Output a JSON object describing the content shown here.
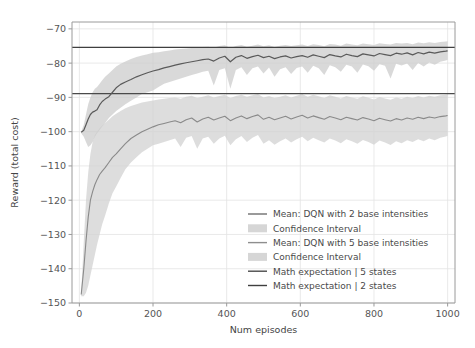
{
  "chart_data": {
    "type": "line",
    "title": "",
    "xlabel": "Num episodes",
    "ylabel": "Reward (total cost)",
    "xlim": [
      -20,
      1020
    ],
    "ylim": [
      -150,
      -68
    ],
    "xticks": [
      0,
      200,
      400,
      600,
      800,
      1000
    ],
    "yticks": [
      -70,
      -80,
      -90,
      -100,
      -110,
      -120,
      -130,
      -140,
      -150
    ],
    "xticklabels": [
      "0",
      "200",
      "400",
      "600",
      "800",
      "1000"
    ],
    "yticklabels": [
      "−70",
      "−80",
      "−90",
      "−100",
      "−110",
      "−120",
      "−130",
      "−140",
      "−150"
    ],
    "grid": true,
    "legend_position": "lower right",
    "colors": {
      "mean_2_base": "#5a5a5a",
      "ci_2_base": "#cccccc",
      "mean_5_base": "#8a8a8a",
      "ci_5_base": "#d2d2d2",
      "math_exp_5_states": "#4a4a4a",
      "math_exp_2_states": "#3f3f3f",
      "grid": "#e3e3e3",
      "spine": "#9a9a9a",
      "background": "#ffffff"
    },
    "hlines": [
      {
        "name": "Math expectation | 2 states",
        "value": -75.4
      },
      {
        "name": "Math expectation | 5 states",
        "value": -88.9
      }
    ],
    "series": [
      {
        "name": "Mean: DQN with 2 base intensities",
        "kind": "mean",
        "x": [
          5,
          12,
          18,
          24,
          30,
          36,
          42,
          48,
          55,
          62,
          70,
          80,
          90,
          100,
          112,
          125,
          140,
          155,
          170,
          185,
          200,
          215,
          230,
          245,
          260,
          275,
          290,
          305,
          320,
          335,
          350,
          365,
          380,
          395,
          410,
          425,
          440,
          455,
          470,
          485,
          500,
          515,
          530,
          545,
          560,
          575,
          590,
          605,
          620,
          635,
          650,
          665,
          680,
          695,
          710,
          725,
          740,
          755,
          770,
          785,
          800,
          815,
          830,
          845,
          860,
          875,
          890,
          905,
          920,
          935,
          950,
          965,
          980,
          995,
          1000
        ],
        "y": [
          -100.2,
          -99.6,
          -98.0,
          -96.3,
          -95.0,
          -94.3,
          -94.0,
          -93.6,
          -92.2,
          -91.2,
          -90.5,
          -89.8,
          -88.5,
          -87.2,
          -86.2,
          -85.5,
          -84.8,
          -84.0,
          -83.4,
          -82.8,
          -82.3,
          -81.9,
          -81.4,
          -81.0,
          -80.6,
          -80.2,
          -79.9,
          -79.6,
          -79.3,
          -79.0,
          -78.8,
          -79.4,
          -78.5,
          -78.0,
          -79.6,
          -78.3,
          -77.8,
          -78.6,
          -78.1,
          -77.7,
          -78.4,
          -78.0,
          -78.7,
          -78.2,
          -77.9,
          -78.5,
          -78.1,
          -77.8,
          -78.3,
          -77.6,
          -78.0,
          -78.4,
          -77.5,
          -77.9,
          -78.2,
          -77.4,
          -77.8,
          -78.1,
          -77.3,
          -77.6,
          -77.9,
          -77.2,
          -77.5,
          -77.8,
          -77.1,
          -77.4,
          -77.0,
          -77.6,
          -76.9,
          -77.3,
          -76.8,
          -77.1,
          -76.7,
          -76.5,
          -76.4
        ]
      },
      {
        "name": "Confidence Interval (2 base intensities)",
        "kind": "ci",
        "x": [
          5,
          12,
          18,
          24,
          30,
          36,
          42,
          48,
          55,
          62,
          70,
          80,
          90,
          100,
          112,
          125,
          140,
          155,
          170,
          185,
          200,
          215,
          230,
          245,
          260,
          275,
          290,
          305,
          320,
          335,
          350,
          365,
          380,
          395,
          410,
          425,
          440,
          455,
          470,
          485,
          500,
          515,
          530,
          545,
          560,
          575,
          590,
          605,
          620,
          635,
          650,
          665,
          680,
          695,
          710,
          725,
          740,
          755,
          770,
          785,
          800,
          815,
          830,
          845,
          860,
          875,
          890,
          905,
          920,
          935,
          950,
          965,
          980,
          995,
          1000
        ],
        "lower": [
          -100.5,
          -101.5,
          -103.0,
          -104.5,
          -104.0,
          -103.0,
          -101.5,
          -100.5,
          -99.5,
          -98.5,
          -97.5,
          -96.0,
          -95.0,
          -94.0,
          -93.0,
          -92.0,
          -91.0,
          -90.0,
          -89.0,
          -88.5,
          -88.0,
          -87.0,
          -86.0,
          -85.5,
          -85.0,
          -84.5,
          -84.0,
          -83.5,
          -83.0,
          -82.5,
          -82.2,
          -86.5,
          -82.0,
          -81.5,
          -87.5,
          -82.0,
          -81.2,
          -83.5,
          -81.5,
          -81.0,
          -83.0,
          -81.3,
          -84.0,
          -81.8,
          -81.2,
          -83.2,
          -81.4,
          -81.0,
          -82.8,
          -80.8,
          -81.5,
          -83.5,
          -80.6,
          -81.2,
          -82.5,
          -80.5,
          -81.0,
          -82.8,
          -80.4,
          -80.9,
          -82.2,
          -80.3,
          -80.8,
          -84.5,
          -80.2,
          -80.7,
          -80.1,
          -82.0,
          -80.0,
          -81.0,
          -79.8,
          -80.5,
          -79.6,
          -79.2,
          -79.0
        ],
        "upper": [
          -100.0,
          -98.0,
          -95.0,
          -92.0,
          -90.0,
          -88.5,
          -87.5,
          -87.0,
          -86.0,
          -85.0,
          -84.0,
          -83.0,
          -82.0,
          -81.0,
          -80.2,
          -79.5,
          -78.8,
          -78.2,
          -77.8,
          -77.4,
          -77.0,
          -76.8,
          -76.5,
          -76.3,
          -76.0,
          -75.9,
          -75.7,
          -75.6,
          -75.4,
          -75.3,
          -75.2,
          -75.5,
          -75.0,
          -74.8,
          -75.6,
          -75.0,
          -74.7,
          -75.2,
          -74.9,
          -74.6,
          -75.1,
          -74.8,
          -75.3,
          -74.9,
          -74.7,
          -75.0,
          -74.8,
          -74.6,
          -75.0,
          -74.5,
          -74.7,
          -75.1,
          -74.4,
          -74.6,
          -74.9,
          -74.3,
          -74.6,
          -74.8,
          -74.3,
          -74.5,
          -74.7,
          -74.2,
          -74.4,
          -74.6,
          -74.1,
          -74.3,
          -74.1,
          -74.5,
          -74.0,
          -74.2,
          -73.9,
          -74.1,
          -73.8,
          -73.7,
          -73.6
        ]
      },
      {
        "name": "Mean: DQN with 5 base intensities",
        "kind": "mean",
        "x": [
          5,
          12,
          18,
          24,
          30,
          36,
          42,
          48,
          55,
          62,
          70,
          80,
          90,
          100,
          112,
          125,
          140,
          155,
          170,
          185,
          200,
          215,
          230,
          245,
          260,
          275,
          290,
          305,
          320,
          335,
          350,
          365,
          380,
          395,
          410,
          425,
          440,
          455,
          470,
          485,
          500,
          515,
          530,
          545,
          560,
          575,
          590,
          605,
          620,
          635,
          650,
          665,
          680,
          695,
          710,
          725,
          740,
          755,
          770,
          785,
          800,
          815,
          830,
          845,
          860,
          875,
          890,
          905,
          920,
          935,
          950,
          965,
          980,
          995,
          1000
        ],
        "y": [
          -147.5,
          -140.0,
          -132.0,
          -125.0,
          -120.0,
          -117.5,
          -115.5,
          -114.0,
          -112.5,
          -111.5,
          -110.5,
          -109.0,
          -107.5,
          -106.5,
          -105.0,
          -103.5,
          -102.0,
          -101.0,
          -100.0,
          -99.3,
          -98.6,
          -98.0,
          -97.6,
          -97.2,
          -96.8,
          -97.4,
          -96.5,
          -96.0,
          -97.2,
          -96.3,
          -95.8,
          -96.6,
          -96.0,
          -95.5,
          -96.8,
          -96.0,
          -95.4,
          -96.2,
          -95.6,
          -95.1,
          -96.4,
          -95.8,
          -96.5,
          -96.0,
          -95.5,
          -96.3,
          -95.7,
          -95.2,
          -96.0,
          -95.4,
          -95.9,
          -96.4,
          -95.6,
          -96.0,
          -96.5,
          -95.8,
          -96.2,
          -96.6,
          -95.9,
          -96.3,
          -96.8,
          -96.1,
          -96.5,
          -96.9,
          -96.2,
          -96.6,
          -96.0,
          -96.4,
          -95.8,
          -96.2,
          -95.7,
          -96.0,
          -95.6,
          -95.4,
          -95.3
        ]
      },
      {
        "name": "Confidence Interval (5 base intensities)",
        "kind": "ci",
        "x": [
          5,
          12,
          18,
          24,
          30,
          36,
          42,
          48,
          55,
          62,
          70,
          80,
          90,
          100,
          112,
          125,
          140,
          155,
          170,
          185,
          200,
          215,
          230,
          245,
          260,
          275,
          290,
          305,
          320,
          335,
          350,
          365,
          380,
          395,
          410,
          425,
          440,
          455,
          470,
          485,
          500,
          515,
          530,
          545,
          560,
          575,
          590,
          605,
          620,
          635,
          650,
          665,
          680,
          695,
          710,
          725,
          740,
          755,
          770,
          785,
          800,
          815,
          830,
          845,
          860,
          875,
          890,
          905,
          920,
          935,
          950,
          965,
          980,
          995,
          1000
        ],
        "lower": [
          -148.0,
          -148.0,
          -147.0,
          -145.0,
          -142.0,
          -139.0,
          -136.0,
          -133.0,
          -130.0,
          -127.0,
          -124.5,
          -121.0,
          -118.0,
          -116.0,
          -113.5,
          -111.0,
          -109.0,
          -107.5,
          -106.0,
          -105.0,
          -104.0,
          -103.5,
          -103.0,
          -102.5,
          -102.0,
          -104.5,
          -101.8,
          -101.3,
          -105.0,
          -102.0,
          -101.5,
          -103.5,
          -102.0,
          -101.2,
          -104.0,
          -102.2,
          -101.3,
          -103.0,
          -101.8,
          -101.0,
          -103.5,
          -102.5,
          -103.8,
          -102.8,
          -102.0,
          -103.2,
          -102.2,
          -101.5,
          -102.8,
          -101.8,
          -102.5,
          -103.2,
          -102.0,
          -102.6,
          -103.4,
          -102.2,
          -102.8,
          -103.5,
          -102.4,
          -103.0,
          -103.8,
          -102.6,
          -103.2,
          -103.9,
          -102.8,
          -103.4,
          -102.5,
          -103.0,
          -102.2,
          -102.8,
          -102.0,
          -102.5,
          -101.8,
          -101.4,
          -101.2
        ],
        "upper": [
          -147.0,
          -132.0,
          -120.0,
          -112.0,
          -106.5,
          -103.0,
          -101.0,
          -100.0,
          -99.0,
          -98.2,
          -97.5,
          -96.5,
          -95.5,
          -94.8,
          -94.0,
          -93.2,
          -92.5,
          -92.0,
          -91.5,
          -91.2,
          -90.9,
          -90.6,
          -90.4,
          -90.2,
          -90.0,
          -90.4,
          -89.8,
          -89.5,
          -90.2,
          -89.8,
          -89.4,
          -90.0,
          -89.6,
          -89.2,
          -90.2,
          -89.6,
          -89.2,
          -89.8,
          -89.4,
          -89.0,
          -90.0,
          -89.6,
          -90.2,
          -89.8,
          -89.4,
          -90.0,
          -89.5,
          -89.0,
          -89.8,
          -89.2,
          -89.7,
          -90.2,
          -89.4,
          -89.8,
          -90.3,
          -89.6,
          -90.0,
          -90.4,
          -89.7,
          -90.1,
          -90.6,
          -89.9,
          -90.3,
          -90.7,
          -90.0,
          -90.4,
          -89.8,
          -90.2,
          -89.6,
          -90.0,
          -89.5,
          -89.8,
          -89.4,
          -89.2,
          -89.1
        ]
      }
    ],
    "legend": [
      {
        "label": "Mean: DQN with 2 base intensities",
        "marker": "line",
        "color": "#6f6f6f"
      },
      {
        "label": "Confidence Interval",
        "marker": "patch",
        "color": "#d6d6d6"
      },
      {
        "label": "Mean: DQN with 5 base intensities",
        "marker": "line",
        "color": "#8e8e8e"
      },
      {
        "label": "Confidence Interval",
        "marker": "patch",
        "color": "#d6d6d6"
      },
      {
        "label": "Math expectation | 5 states",
        "marker": "line",
        "color": "#4a4a4a"
      },
      {
        "label": "Math expectation | 2 states",
        "marker": "line",
        "color": "#3f3f3f"
      }
    ]
  }
}
